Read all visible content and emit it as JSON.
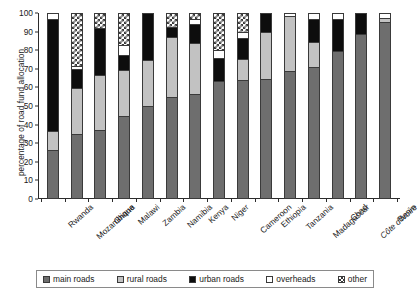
{
  "chart_data": {
    "type": "bar",
    "stacked": true,
    "title": "",
    "xlabel": "",
    "ylabel": "percentage of road fund allocation",
    "ylim": [
      0,
      100
    ],
    "yticks": [
      0,
      10,
      20,
      30,
      40,
      50,
      60,
      70,
      80,
      90,
      100
    ],
    "grid": false,
    "legend_position": "bottom",
    "categories": [
      "Rwanda",
      "Mozambique",
      "Ghana",
      "Malawi",
      "Zambia",
      "Namibia",
      "Kenya",
      "Niger",
      "Cameroon",
      "Ethiopia",
      "Tanzania",
      "Madagascar",
      "Chad",
      "Côte d'Ivoire",
      "Benin"
    ],
    "series": [
      {
        "name": "main roads",
        "color": "#6e6e6e",
        "values": [
          26,
          35,
          37,
          45,
          50,
          55,
          57,
          64,
          65,
          65,
          69,
          72,
          80,
          89,
          96
        ]
      },
      {
        "name": "rural roads",
        "color": "#c2c2c2",
        "values": [
          10,
          25,
          30,
          25,
          25,
          33,
          28,
          0,
          11,
          25,
          30,
          13,
          0,
          0,
          2
        ]
      },
      {
        "name": "urban roads",
        "color": "#0d0d0d",
        "values": [
          61,
          10,
          25,
          8,
          25,
          5,
          10,
          12,
          11,
          10,
          0,
          12,
          17,
          11,
          0
        ]
      },
      {
        "name": "overheads",
        "color": "#ffffff",
        "values": [
          3,
          1,
          0,
          5,
          0,
          0,
          2,
          4,
          3,
          0,
          1,
          3,
          3,
          0,
          2
        ]
      },
      {
        "name": "other",
        "color": "checkered",
        "values": [
          0,
          29,
          8,
          17,
          0,
          7,
          3,
          20,
          10,
          0,
          0,
          0,
          0,
          0,
          0
        ]
      }
    ],
    "italic_categories": [
      "Côte d'Ivoire"
    ]
  },
  "legend": {
    "items": [
      {
        "label": "main roads",
        "key": "main"
      },
      {
        "label": "rural roads",
        "key": "rural"
      },
      {
        "label": "urban roads",
        "key": "urban"
      },
      {
        "label": "overheads",
        "key": "overheads"
      },
      {
        "label": "other",
        "key": "other"
      }
    ]
  }
}
